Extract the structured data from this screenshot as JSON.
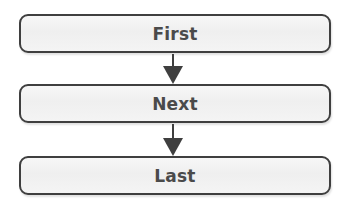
{
  "diagram": {
    "type": "flowchart",
    "direction": "top-to-bottom",
    "nodes": [
      {
        "id": "first",
        "label": "First"
      },
      {
        "id": "next",
        "label": "Next"
      },
      {
        "id": "last",
        "label": "Last"
      }
    ],
    "edges": [
      {
        "from": "first",
        "to": "next",
        "icon": "arrow-down-icon"
      },
      {
        "from": "next",
        "to": "last",
        "icon": "arrow-down-icon"
      }
    ],
    "colors": {
      "stroke": "#3f3f3f",
      "fill": "#f2f2f2",
      "text": "#4a4a4a"
    }
  }
}
